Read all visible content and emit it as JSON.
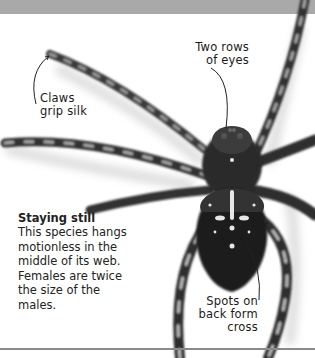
{
  "figure": {
    "annotations": [
      {
        "id": "eyes",
        "text_lines": [
          "Two rows",
          "of eyes"
        ]
      },
      {
        "id": "claws",
        "text_lines": [
          "Claws",
          "grip silk"
        ]
      },
      {
        "id": "spots",
        "text_lines": [
          "Spots on",
          "back form",
          "cross"
        ]
      }
    ]
  },
  "caption": {
    "title": "Staying still",
    "body": "This species hangs motionless in the middle of its web. Females are twice the size of the males."
  },
  "colors": {
    "top_band": "#a9a9a9",
    "background": "#ffffff",
    "rule": "#8a8a8a",
    "text": "#1a1a1a"
  }
}
